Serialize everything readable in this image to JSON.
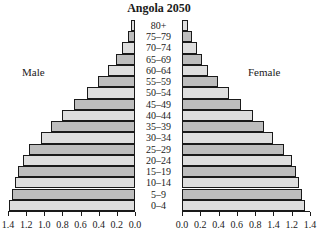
{
  "chart_data": {
    "type": "bar",
    "orientation": "horizontal",
    "subtype": "population-pyramid",
    "title": "Angola 2050",
    "categories": [
      "80+",
      "75–79",
      "70–74",
      "65–69",
      "60–64",
      "55–59",
      "50–54",
      "45–49",
      "40–44",
      "35–39",
      "30–34",
      "25–29",
      "20–24",
      "15–19",
      "10–14",
      "5–9",
      "0–4"
    ],
    "series": [
      {
        "name": "Male",
        "values": [
          0.04,
          0.08,
          0.14,
          0.21,
          0.3,
          0.41,
          0.53,
          0.67,
          0.8,
          0.93,
          1.04,
          1.17,
          1.23,
          1.29,
          1.32,
          1.36,
          1.39
        ]
      },
      {
        "name": "Female",
        "values": [
          0.07,
          0.11,
          0.16,
          0.22,
          0.28,
          0.39,
          0.51,
          0.65,
          0.78,
          0.9,
          0.99,
          1.12,
          1.2,
          1.25,
          1.28,
          1.31,
          1.35
        ]
      }
    ],
    "left_axis_ticks": [
      "1.4",
      "1.2",
      "1.0",
      "0.8",
      "0.6",
      "0.4",
      "0.2",
      "0.0"
    ],
    "right_axis_ticks": [
      "0.0",
      "0.2",
      "0.4",
      "0.6",
      "0.8",
      "1.4",
      "1.2",
      "1.4"
    ],
    "xlim": [
      0,
      1.4
    ],
    "xlabel": "",
    "ylabel": "",
    "grid": false,
    "legend": "side labels: Male (left), Female (right)"
  },
  "labels": {
    "title": "Angola 2050",
    "male": "Male",
    "female": "Female"
  },
  "colors": {
    "bar_dark": "#bdbdbd",
    "bar_light": "#dedede",
    "border": "#1a1a1a"
  }
}
